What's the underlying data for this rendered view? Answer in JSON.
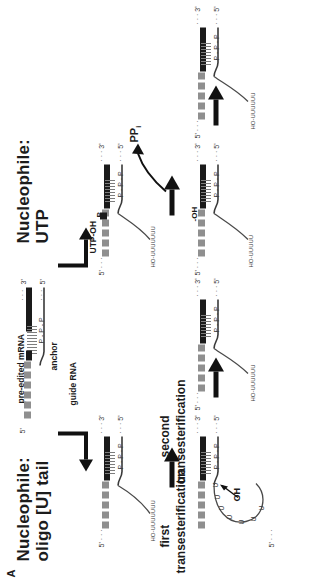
{
  "figure": {
    "panel_letter": "A",
    "headings": {
      "left_nucleophile": "Nucleophile:",
      "left_species": "oligo [U] tail",
      "right_nucleophile": "Nucleophile:",
      "right_species": "UTP"
    },
    "steps": {
      "first_line1": "first",
      "first_line2": "transesterification",
      "second_line1": "second",
      "second_line2": "transesterification"
    },
    "annotations": {
      "pre_edited_mrna": "pre-edited mRNA",
      "anchor": "anchor",
      "guide_rna": "guide RNA",
      "utp_oh": "UTP-OH",
      "pyrophosphate": "PP",
      "pyrophosphate_sub": "i",
      "hydroxyl": "-OH",
      "hydroxyl_attack": "OH",
      "phosphate_p": "P"
    },
    "termini": {
      "three_prime": "3'",
      "five_prime": "5'",
      "dots_left": "5'",
      "dots_right": "3'",
      "mrna_five": "5'",
      "mrna_three": "3'"
    },
    "sequences": {
      "phosphate_chain": "P - P - P",
      "utail_free": "HO-UU",
      "utail_run": "UUUUU",
      "utail_product": "HO-UU",
      "utail_product_run": "UUUU",
      "u_base": "U"
    },
    "colors": {
      "mrna": "#1a1a1a",
      "grna_block": "#8f8f8f",
      "backbone": "#3a3a3a",
      "text": "#1c1c1c",
      "background": "#ffffff",
      "arrow": "#111111"
    },
    "arrows": {
      "bent_left": "bent-arrow-down-right",
      "bent_right": "bent-arrow-down-right",
      "step1_left": "right-arrow",
      "step2_left": "right-arrow",
      "step1_right": "right-arrow",
      "step2_right": "right-arrow",
      "pp_release": "curved-arrow-release"
    }
  }
}
